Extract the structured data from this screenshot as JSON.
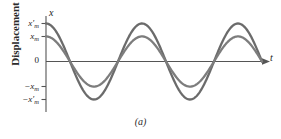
{
  "figure": {
    "caption": "(a)",
    "background_color": "#ffffff"
  },
  "axes": {
    "y_axis_title": "Displacement",
    "y_axis_letter": "x",
    "x_axis_letter": "t",
    "axis_color": "#555555",
    "tick_labels": [
      {
        "id": "x-prime-m-pos",
        "base": "x",
        "prime": "′",
        "sub": "m",
        "sign": ""
      },
      {
        "id": "x-m-pos",
        "base": "x",
        "prime": "",
        "sub": "m",
        "sign": ""
      },
      {
        "id": "zero",
        "base": "0",
        "prime": "",
        "sub": "",
        "sign": ""
      },
      {
        "id": "x-m-neg",
        "base": "x",
        "prime": "",
        "sub": "m",
        "sign": "−"
      },
      {
        "id": "x-prime-m-neg",
        "base": "x",
        "prime": "′",
        "sub": "m",
        "sign": "−"
      }
    ]
  },
  "chart_data": {
    "type": "line",
    "title": "",
    "xlabel": "t",
    "ylabel": "Displacement",
    "grid": false,
    "legend": null,
    "xlim": [
      0,
      2.25
    ],
    "ylim": [
      -1.15,
      1.15
    ],
    "x_tick_labels": [],
    "y_tick_labels": [
      "x′m",
      "xm",
      "0",
      "−xm",
      "−x′m"
    ],
    "y_tick_values": [
      1.0,
      0.66,
      0,
      -0.66,
      -1.0
    ],
    "series": [
      {
        "name": "x′(t) larger amplitude",
        "form": "cosine",
        "amplitude": 1.0,
        "period": 1.0,
        "phase": 0,
        "color": "#6b6b6b",
        "line_width": 2.3
      },
      {
        "name": "x(t) smaller amplitude",
        "form": "cosine",
        "amplitude": 0.66,
        "period": 1.0,
        "phase": 0,
        "color": "#7d7d7d",
        "line_width": 2.3
      }
    ]
  }
}
